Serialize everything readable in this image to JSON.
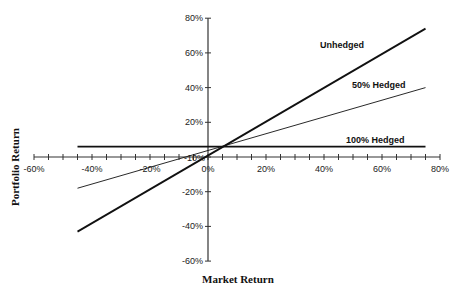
{
  "chart_data": {
    "type": "line",
    "title": "",
    "xlabel": "Market Return",
    "ylabel": "Portfolio Return",
    "xlim": [
      -60,
      80
    ],
    "ylim": [
      -60,
      80
    ],
    "x_tick_labels": [
      "-60%",
      "-40%",
      "-20%",
      "0%",
      "20%",
      "40%",
      "60%",
      "80%"
    ],
    "x_ticks": [
      -60,
      -40,
      -20,
      0,
      20,
      40,
      60,
      80
    ],
    "x_minor_tick_step": 5,
    "y_tick_labels": [
      "80%",
      "60%",
      "40%",
      "20%",
      "0%",
      "-20%",
      "-40%",
      "-60%"
    ],
    "y_ticks": [
      80,
      60,
      40,
      20,
      0,
      -20,
      -40,
      -60
    ],
    "extra_label": "-10%",
    "grid": false,
    "legend_position": "inline labels near line ends",
    "series": [
      {
        "name": "Unhedged",
        "x": [
          -45,
          75
        ],
        "values": [
          -43,
          74
        ],
        "line_width": 2
      },
      {
        "name": "50% Hedged",
        "x": [
          -45,
          75
        ],
        "values": [
          -18,
          40
        ],
        "line_width": 1
      },
      {
        "name": "100% Hedged",
        "x": [
          -45,
          75
        ],
        "values": [
          6,
          6
        ],
        "line_width": 2
      }
    ]
  },
  "labels": {
    "unhedged": "Unhedged",
    "half_hedged": "50% Hedged",
    "full_hedged": "100% Hedged",
    "x_axis_title": "Market Return",
    "y_axis_title": "Portfolio Return",
    "neg10": "-10%"
  }
}
